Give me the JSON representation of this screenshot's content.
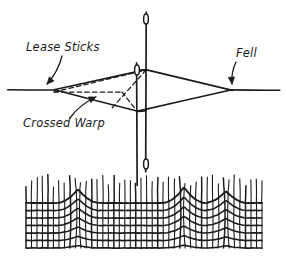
{
  "figure": {
    "title_visible": false,
    "background_color": "#ffffff",
    "ink_color": "#1b1b1b"
  },
  "labels": [
    {
      "id": "lease-sticks",
      "text": "Lease Sticks",
      "x": 26,
      "y": 51,
      "anchor": "start",
      "arrow": {
        "from_x": 62,
        "from_y": 56,
        "to_x": 47,
        "to_y": 84,
        "curve_x": 58,
        "curve_y": 72,
        "head": "down-left"
      }
    },
    {
      "id": "fell",
      "text": "Fell",
      "x": 236,
      "y": 57,
      "anchor": "start",
      "arrow": {
        "from_x": 236,
        "from_y": 62,
        "to_x": 232,
        "to_y": 84,
        "curve_x": 231,
        "curve_y": 72,
        "head": "down"
      }
    },
    {
      "id": "crossed-warp",
      "text": "Crossed Warp",
      "x": 23,
      "y": 127,
      "anchor": "start",
      "arrow": {
        "from_x": 70,
        "from_y": 118,
        "to_x": 96,
        "to_y": 97,
        "curve_x": 80,
        "curve_y": 104,
        "head": "up-right"
      }
    }
  ],
  "shed_diagram": {
    "warp_baseline_y": 90,
    "left_apex": {
      "x": 54,
      "y": 90
    },
    "right_apex": {
      "x": 232,
      "y": 90
    },
    "upper_peak": {
      "x": 146,
      "y": 70
    },
    "lower_peak": {
      "x": 137,
      "y": 111
    },
    "left_tail_x": 8,
    "right_tail_x": 280,
    "dashed_lines": [
      {
        "id": "crossed-warp-lower",
        "x1": 54,
        "y1": 92,
        "x2": 146,
        "y2": 70
      },
      {
        "id": "crossed-warp-upper",
        "x1": 54,
        "y1": 92,
        "x2": 122,
        "y2": 92
      },
      {
        "id": "crossed-warp-diag-a",
        "x1": 146,
        "y1": 70,
        "x2": 112,
        "y2": 108
      },
      {
        "id": "crossed-warp-diag-b",
        "x1": 122,
        "y1": 92,
        "x2": 137,
        "y2": 111
      }
    ]
  },
  "lease_sticks": [
    {
      "id": "long-stick",
      "x": 146,
      "top_y": 12,
      "bottom_y": 172,
      "eye_top": {
        "cx": 146,
        "cy": 19,
        "rx": 2.4,
        "ry": 5
      },
      "eye_bottom": {
        "cx": 146,
        "cy": 164,
        "rx": 2.4,
        "ry": 5
      }
    },
    {
      "id": "short-stick",
      "x": 137,
      "top_y": 63,
      "bottom_y": 185,
      "eye_top": {
        "cx": 137,
        "cy": 70,
        "rx": 2.4,
        "ry": 5
      }
    }
  ],
  "cloth_diagram": {
    "left_x": 26,
    "right_x": 262,
    "fabric_top_y": 203,
    "fabric_bottom_y": 248,
    "warp_top_y": 172,
    "warp_thread_count": 44,
    "weft_row_count": 7,
    "peaks": [
      {
        "x": 78,
        "height": 14
      },
      {
        "x": 184,
        "height": 16
      },
      {
        "x": 226,
        "height": 12
      }
    ]
  }
}
